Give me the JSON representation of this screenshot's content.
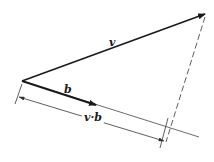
{
  "diagram": {
    "labels": {
      "v": "v",
      "b": "b",
      "dot": "v·b"
    },
    "colors": {
      "stroke": "#1a1a1a",
      "thin": "#333333",
      "background": "#ffffff"
    },
    "geometry": {
      "origin": [
        22,
        81
      ],
      "v_tip": [
        206,
        14
      ],
      "b_tip": [
        97,
        105
      ],
      "projection_line_end": [
        199,
        137
      ],
      "dashed_start": [
        205,
        16
      ],
      "dashed_end": [
        166,
        142
      ],
      "dim_left_tick": [
        [
          22,
          84
        ],
        [
          15,
          104
        ]
      ],
      "dim_right_tick": [
        [
          168,
          118
        ],
        [
          160,
          148
        ]
      ],
      "dim_line": [
        [
          19,
          97
        ],
        [
          165,
          141
        ]
      ]
    }
  }
}
